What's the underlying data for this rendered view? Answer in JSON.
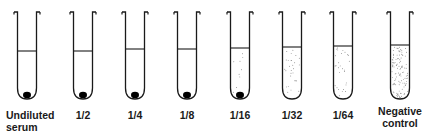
{
  "figure": {
    "colors": {
      "line": "#1a1a1a",
      "dots": "#555555",
      "pellet": "#000000",
      "background": "#ffffff"
    },
    "tubes": [
      {
        "cx": 27,
        "label_line1": "Undiluted",
        "label_line2": "serum",
        "liquid_top": 51,
        "pellet": true,
        "dot_density": "none"
      },
      {
        "cx": 83,
        "label_line1": "1/2",
        "label_line2": "",
        "liquid_top": 51,
        "pellet": true,
        "dot_density": "none"
      },
      {
        "cx": 135,
        "label_line1": "1/4",
        "label_line2": "",
        "liquid_top": 49,
        "pellet": true,
        "dot_density": "none"
      },
      {
        "cx": 187,
        "label_line1": "1/8",
        "label_line2": "",
        "liquid_top": 49,
        "pellet": true,
        "dot_density": "none"
      },
      {
        "cx": 240,
        "label_line1": "1/16",
        "label_line2": "",
        "liquid_top": 48,
        "pellet": true,
        "dot_density": "sparse"
      },
      {
        "cx": 292,
        "label_line1": "1/32",
        "label_line2": "",
        "liquid_top": 47,
        "pellet": false,
        "dot_density": "medium"
      },
      {
        "cx": 343,
        "label_line1": "1/64",
        "label_line2": "",
        "liquid_top": 46,
        "pellet": false,
        "dot_density": "medium"
      },
      {
        "cx": 400,
        "label_line1": "Negative",
        "label_line2": "control",
        "liquid_top": 45,
        "pellet": false,
        "dot_density": "dense"
      }
    ]
  }
}
